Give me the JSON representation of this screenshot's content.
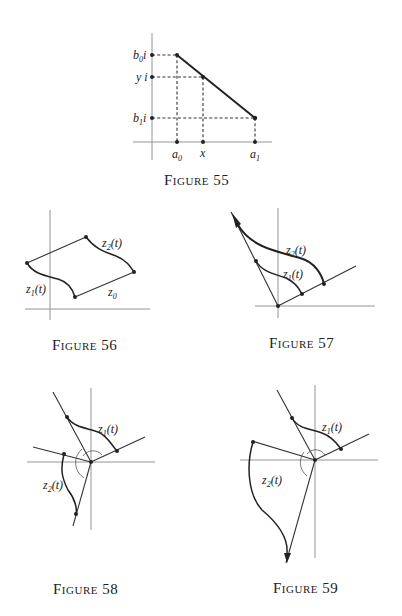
{
  "figures": [
    {
      "id": "55",
      "caption": "Figure 55",
      "labels": {
        "b0": "b",
        "b0_sub": "0",
        "b0_suffix": "i",
        "y": "y i",
        "b1": "b",
        "b1_sub": "1",
        "b1_suffix": "i",
        "a0": "a",
        "a0_sub": "0",
        "x": "x",
        "a1": "a",
        "a1_sub": "1"
      }
    },
    {
      "id": "56",
      "caption": "Figure 56",
      "labels": {
        "z2": "z",
        "z2_sub": "2",
        "z2_arg": "(t)",
        "z1": "z",
        "z1_sub": "1",
        "z1_arg": "(t)",
        "z0": "z",
        "z0_sub": "0"
      }
    },
    {
      "id": "57",
      "caption": "Figure 57",
      "labels": {
        "z2": "z",
        "z2_sub": "2",
        "z2_arg": "(t)",
        "z1": "z",
        "z1_sub": "1",
        "z1_arg": "(t)"
      }
    },
    {
      "id": "58",
      "caption": "Figure 58",
      "labels": {
        "z1": "z",
        "z1_sub": "1",
        "z1_arg": "(t)",
        "z2": "z",
        "z2_sub": "2",
        "z2_arg": "(t)"
      }
    },
    {
      "id": "59",
      "caption": "Figure 59",
      "labels": {
        "z1": "z",
        "z1_sub": "1",
        "z1_arg": "(t)",
        "z2": "z",
        "z2_sub": "2",
        "z2_arg": "(t)"
      }
    }
  ]
}
